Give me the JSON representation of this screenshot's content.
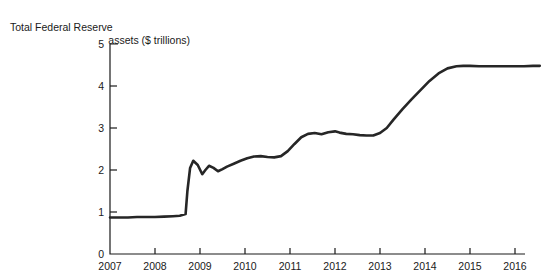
{
  "chart_data": {
    "type": "line",
    "title": "Total Federal Reserve assets ($ trillions)",
    "title_line1": "Total Federal Reserve",
    "title_line2": "assets ($ trillions)",
    "xlabel": "",
    "ylabel": "",
    "xlim": [
      2007,
      2016.6
    ],
    "ylim": [
      0,
      5
    ],
    "yticks": [
      0,
      1,
      2,
      3,
      4,
      5
    ],
    "ytick_labels": [
      "0",
      "1",
      "2",
      "3",
      "4",
      "5"
    ],
    "xticks": [
      2007,
      2008,
      2009,
      2010,
      2011,
      2012,
      2013,
      2014,
      2015,
      2016
    ],
    "xtick_labels": [
      "2007",
      "2008",
      "2009",
      "2010",
      "2011",
      "2012",
      "2013",
      "2014",
      "2015",
      "2016"
    ],
    "grid": false,
    "legend": false,
    "line_color": "#262626",
    "line_width": 2.6,
    "axis_color": "#1a1a1a",
    "series": [
      {
        "name": "Total Federal Reserve assets",
        "x": [
          2007.0,
          2007.2,
          2007.4,
          2007.6,
          2007.8,
          2008.0,
          2008.2,
          2008.4,
          2008.55,
          2008.68,
          2008.72,
          2008.78,
          2008.85,
          2008.95,
          2009.05,
          2009.12,
          2009.2,
          2009.3,
          2009.4,
          2009.5,
          2009.6,
          2009.75,
          2009.9,
          2010.05,
          2010.2,
          2010.35,
          2010.5,
          2010.65,
          2010.8,
          2010.95,
          2011.1,
          2011.25,
          2011.4,
          2011.55,
          2011.7,
          2011.85,
          2012.0,
          2012.1,
          2012.25,
          2012.4,
          2012.55,
          2012.7,
          2012.85,
          2013.0,
          2013.15,
          2013.3,
          2013.5,
          2013.7,
          2013.9,
          2014.1,
          2014.3,
          2014.5,
          2014.7,
          2014.85,
          2015.0,
          2015.2,
          2015.4,
          2015.6,
          2015.8,
          2016.0,
          2016.2,
          2016.4,
          2016.55
        ],
        "y": [
          0.87,
          0.87,
          0.87,
          0.88,
          0.88,
          0.88,
          0.89,
          0.9,
          0.91,
          0.95,
          1.5,
          2.05,
          2.22,
          2.12,
          1.9,
          2.0,
          2.1,
          2.05,
          1.97,
          2.02,
          2.08,
          2.15,
          2.22,
          2.28,
          2.32,
          2.33,
          2.31,
          2.3,
          2.33,
          2.45,
          2.62,
          2.78,
          2.86,
          2.88,
          2.85,
          2.9,
          2.92,
          2.89,
          2.86,
          2.85,
          2.83,
          2.82,
          2.82,
          2.88,
          3.0,
          3.2,
          3.45,
          3.68,
          3.9,
          4.12,
          4.3,
          4.42,
          4.47,
          4.48,
          4.48,
          4.47,
          4.47,
          4.47,
          4.47,
          4.47,
          4.47,
          4.48,
          4.48
        ]
      }
    ],
    "annotations": [
      {
        "text": "Sharp expansion beginning late 2008",
        "x": 2008.8,
        "y": 2.2
      }
    ]
  }
}
